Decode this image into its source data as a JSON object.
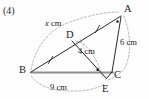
{
  "item": {
    "number": "(4)"
  },
  "figure": {
    "type": "geometry-diagram",
    "vertices": [
      {
        "id": "A",
        "label": "A",
        "x": 122,
        "y": 14
      },
      {
        "id": "B",
        "label": "B",
        "x": 30,
        "y": 72
      },
      {
        "id": "C",
        "label": "C",
        "x": 113,
        "y": 72
      },
      {
        "id": "D",
        "label": "D",
        "x": 72,
        "y": 40
      },
      {
        "id": "E",
        "label": "E",
        "x": 106,
        "y": 83
      }
    ],
    "segments": [
      {
        "from": "B",
        "to": "A",
        "style": "solid",
        "note": "passes through D"
      },
      {
        "from": "B",
        "to": "C",
        "style": "solid-thick"
      },
      {
        "from": "D",
        "to": "E",
        "style": "solid"
      },
      {
        "from": "A",
        "to": "C",
        "style": "solid"
      },
      {
        "from": "C",
        "to": "E",
        "style": "solid"
      }
    ],
    "measure_arcs": [
      {
        "id": "arc-x",
        "from": "B",
        "to": "A",
        "label": "x cm"
      },
      {
        "id": "arc-4",
        "from": "D",
        "to": "E",
        "label": "4 cm"
      },
      {
        "id": "arc-6",
        "from": "A",
        "to": "C",
        "label": "6 cm"
      },
      {
        "id": "arc-9",
        "from": "B",
        "to": "E",
        "label": "9 cm"
      }
    ],
    "labels": {
      "x_cm": "x cm",
      "x_symbol": "x",
      "x_unit": " cm",
      "four_cm": "4 cm",
      "six_cm": "6 cm",
      "nine_cm": "9 cm"
    },
    "marks": [
      {
        "id": "tick-BD",
        "type": "congruence-tick",
        "on": "B-D"
      },
      {
        "id": "tick-DA",
        "type": "congruence-tick",
        "on": "D-A"
      },
      {
        "id": "right-angle-E",
        "type": "right-angle-dot",
        "at": "E"
      },
      {
        "id": "angle-dot-A",
        "type": "angle-dot",
        "at": "A"
      },
      {
        "id": "angle-arc-D",
        "type": "angle-arc",
        "at": "D"
      }
    ],
    "colors": {
      "stroke": "#2b2b2b",
      "thick_stroke": "#8d8d8d",
      "dashed": "#9a9a9a",
      "text": "#1b1b1b",
      "background": "#fdfdfd"
    }
  }
}
